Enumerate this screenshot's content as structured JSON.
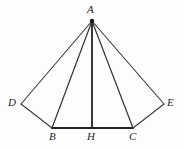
{
  "figure": {
    "width": 184,
    "height": 149,
    "background_color": "#fdfdfc",
    "stroke_color": "#3a3a3a",
    "stroke_color_dark": "#232323",
    "label_color": "#262626"
  },
  "points": [
    {
      "id": "A",
      "label": "A",
      "x": 92,
      "y": 21,
      "label_x": 87,
      "label_y": 4
    },
    {
      "id": "D",
      "label": "D",
      "x": 21,
      "y": 104,
      "label_x": 8,
      "label_y": 97
    },
    {
      "id": "E",
      "label": "E",
      "x": 164,
      "y": 104,
      "label_x": 167,
      "label_y": 97
    },
    {
      "id": "B",
      "label": "B",
      "x": 52,
      "y": 128,
      "label_x": 49,
      "label_y": 131
    },
    {
      "id": "H",
      "label": "H",
      "x": 92,
      "y": 128,
      "label_x": 87,
      "label_y": 131
    },
    {
      "id": "C",
      "label": "C",
      "x": 133,
      "y": 128,
      "label_x": 129,
      "label_y": 131
    }
  ],
  "segments": [
    {
      "id": "AD",
      "from": "A",
      "to": "D",
      "x1": 92,
      "y1": 21,
      "x2": 21,
      "y2": 104,
      "width": 1.1,
      "color": "#3a3a3a"
    },
    {
      "id": "AB",
      "from": "A",
      "to": "B",
      "x1": 92,
      "y1": 21,
      "x2": 52,
      "y2": 128,
      "width": 1.2,
      "color": "#333333"
    },
    {
      "id": "AH",
      "from": "A",
      "to": "H",
      "x1": 92,
      "y1": 21,
      "x2": 92,
      "y2": 128,
      "width": 1.8,
      "color": "#232323"
    },
    {
      "id": "AC",
      "from": "A",
      "to": "C",
      "x1": 92,
      "y1": 21,
      "x2": 133,
      "y2": 128,
      "width": 1.2,
      "color": "#333333"
    },
    {
      "id": "AE",
      "from": "A",
      "to": "E",
      "x1": 92,
      "y1": 21,
      "x2": 164,
      "y2": 104,
      "width": 1.1,
      "color": "#3a3a3a"
    },
    {
      "id": "DB",
      "from": "D",
      "to": "B",
      "x1": 21,
      "y1": 104,
      "x2": 52,
      "y2": 128,
      "width": 1.1,
      "color": "#3a3a3a"
    },
    {
      "id": "BC",
      "from": "B",
      "to": "C",
      "x1": 52,
      "y1": 128,
      "x2": 133,
      "y2": 128,
      "width": 1.8,
      "color": "#232323"
    },
    {
      "id": "CE",
      "from": "C",
      "to": "E",
      "x1": 133,
      "y1": 128,
      "x2": 164,
      "y2": 104,
      "width": 1.1,
      "color": "#3a3a3a"
    }
  ],
  "apex_marker": {
    "cx": 92,
    "cy": 21,
    "r": 2.2,
    "color": "#1a1a1a"
  }
}
